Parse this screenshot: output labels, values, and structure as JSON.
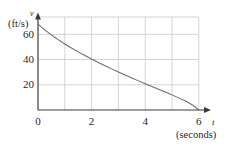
{
  "chart_data": {
    "type": "line",
    "title": "",
    "subtitle": "",
    "xlabel": "t",
    "xlabel_unit": "(seconds)",
    "ylabel": "v",
    "ylabel_unit": "(ft/s)",
    "xlim": [
      0,
      7
    ],
    "ylim": [
      0,
      70
    ],
    "grid": true,
    "grid_x_lines": [
      0,
      1,
      2,
      3,
      4,
      5,
      6
    ],
    "grid_y_lines": [
      0,
      20,
      40,
      60
    ],
    "xticks": [
      0,
      2,
      4,
      6
    ],
    "xticklabels": [
      "0",
      "2",
      "4",
      "6"
    ],
    "yticks": [
      20,
      40,
      60
    ],
    "yticklabels": [
      "20",
      "40",
      "60"
    ],
    "legend": null,
    "legend_position": "none",
    "annotations": [],
    "series": [
      {
        "name": "velocity",
        "x": [
          0,
          0.25,
          0.5,
          0.75,
          1,
          1.25,
          1.5,
          1.75,
          2,
          2.25,
          2.5,
          2.75,
          3,
          3.25,
          3.5,
          3.75,
          4,
          4.25,
          4.5,
          4.75,
          5,
          5.25,
          5.5,
          5.75,
          6
        ],
        "values": [
          68,
          63.5,
          59.5,
          55.8,
          52.3,
          49.1,
          46.1,
          43.2,
          40.4,
          37.7,
          35.1,
          32.6,
          30.1,
          27.7,
          25.4,
          23.1,
          20.8,
          18.6,
          16.4,
          14.2,
          12.0,
          9.6,
          7.1,
          4.2,
          0
        ]
      }
    ]
  },
  "axes": {
    "y_var": "v",
    "y_unit": "(ft/s)",
    "x_var": "t",
    "x_unit": "(seconds)"
  },
  "ticks": {
    "y": [
      "60",
      "40",
      "20"
    ],
    "x": [
      "0",
      "2",
      "4",
      "6"
    ]
  },
  "colors": {
    "curve": "#6b6b6b",
    "axis": "#3a3a3a",
    "grid": "#c9c9c9",
    "text": "#1f1f1f",
    "background": "#ffffff"
  }
}
